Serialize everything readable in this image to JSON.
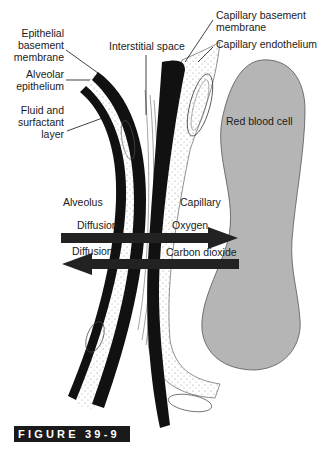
{
  "figure": {
    "caption": "FIGURE 39-9"
  },
  "labels": {
    "epithelial_basement_membrane": "Epithelial\nbasement\nmembrane",
    "alveolar_epithelium": "Alveolar\nepithelium",
    "fluid_surfactant": "Fluid and\nsurfactant\nlayer",
    "interstitial_space": "Interstitial space",
    "capillary_basement_membrane": "Capillary basement\nmembrane",
    "capillary_endothelium": "Capillary endothelium",
    "red_blood_cell": "Red blood cell",
    "alveolus": "Alveolus",
    "capillary": "Capillary",
    "diffusion_top": "Diffusion",
    "oxygen": "Oxygen",
    "diffusion_bottom": "Diffusion",
    "carbon_dioxide": "Carbon dioxide"
  },
  "colors": {
    "membrane": "#111111",
    "rbc_fill": "#b5b5b5",
    "caption_bg": "#1a1a1a"
  }
}
